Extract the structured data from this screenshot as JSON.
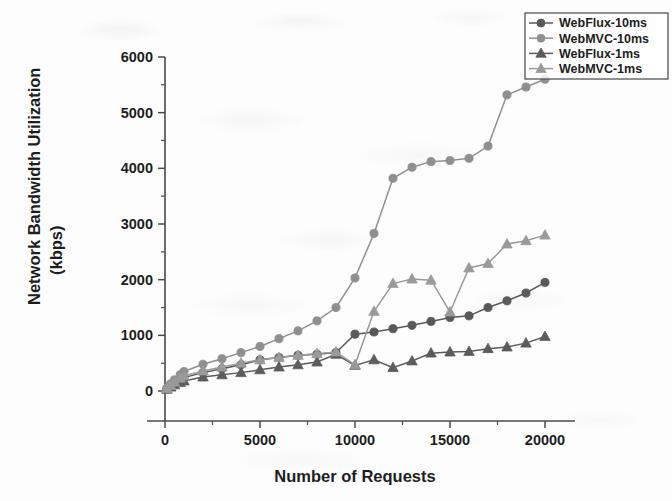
{
  "chart_data": {
    "type": "line",
    "title": "",
    "xlabel": "Number of Requests",
    "ylabel_line1": "Network Bandwidth Utilization",
    "ylabel_line2": "(kbps)",
    "xlim": [
      0,
      20000
    ],
    "ylim": [
      0,
      6000
    ],
    "xticks": [
      0,
      5000,
      10000,
      15000,
      20000
    ],
    "xtick_labels": [
      "0",
      "5000",
      "10000",
      "15000",
      "20000"
    ],
    "yticks": [
      0,
      1000,
      2000,
      3000,
      4000,
      5000,
      6000
    ],
    "ytick_labels": [
      "0",
      "1000",
      "2000",
      "3000",
      "4000",
      "5000",
      "6000"
    ],
    "x_minor_step": 2500,
    "y_minor_step": 500,
    "grid": false,
    "legend_position": "top-right",
    "series": [
      {
        "name": "WebFlux-10ms",
        "marker": "circle",
        "color": "#595959",
        "x": [
          100,
          300,
          500,
          800,
          1000,
          2000,
          3000,
          4000,
          5000,
          6000,
          7000,
          8000,
          9000,
          10000,
          11000,
          12000,
          13000,
          14000,
          15000,
          16000,
          17000,
          18000,
          19000,
          20000
        ],
        "y": [
          40,
          90,
          140,
          200,
          240,
          330,
          400,
          470,
          560,
          600,
          640,
          660,
          690,
          1020,
          1060,
          1120,
          1180,
          1250,
          1320,
          1350,
          1500,
          1620,
          1760,
          1950
        ]
      },
      {
        "name": "WebMVC-10ms",
        "marker": "circle",
        "color": "#8f8f8f",
        "x": [
          100,
          300,
          500,
          800,
          1000,
          2000,
          3000,
          4000,
          5000,
          6000,
          7000,
          8000,
          9000,
          10000,
          11000,
          12000,
          13000,
          14000,
          15000,
          16000,
          17000,
          18000,
          19000,
          20000
        ],
        "y": [
          50,
          130,
          200,
          290,
          350,
          480,
          580,
          690,
          800,
          940,
          1080,
          1260,
          1500,
          2030,
          2830,
          3820,
          4020,
          4120,
          4140,
          4180,
          4400,
          5320,
          5460,
          5600
        ]
      },
      {
        "name": "WebFlux-1ms",
        "marker": "triangle",
        "color": "#5c5c5c",
        "x": [
          100,
          300,
          500,
          800,
          1000,
          2000,
          3000,
          4000,
          5000,
          6000,
          7000,
          8000,
          9000,
          10000,
          11000,
          12000,
          13000,
          14000,
          15000,
          16000,
          17000,
          18000,
          19000,
          20000
        ],
        "y": [
          30,
          70,
          110,
          150,
          180,
          250,
          290,
          330,
          380,
          430,
          470,
          520,
          660,
          460,
          560,
          420,
          540,
          680,
          700,
          710,
          760,
          790,
          860,
          980
        ]
      },
      {
        "name": "WebMVC-1ms",
        "marker": "triangle",
        "color": "#9a9a9a",
        "x": [
          100,
          300,
          500,
          800,
          1000,
          2000,
          3000,
          4000,
          5000,
          6000,
          7000,
          8000,
          9000,
          10000,
          11000,
          12000,
          13000,
          14000,
          15000,
          16000,
          17000,
          18000,
          19000,
          20000
        ],
        "y": [
          45,
          100,
          160,
          230,
          270,
          360,
          430,
          500,
          560,
          600,
          640,
          670,
          700,
          470,
          1430,
          1930,
          2010,
          1990,
          1420,
          2210,
          2290,
          2640,
          2700,
          2800
        ]
      }
    ]
  },
  "legend": {
    "entries": [
      {
        "label": "WebFlux-10ms"
      },
      {
        "label": "WebMVC-10ms"
      },
      {
        "label": "WebFlux-1ms"
      },
      {
        "label": "WebMVC-1ms"
      }
    ]
  }
}
